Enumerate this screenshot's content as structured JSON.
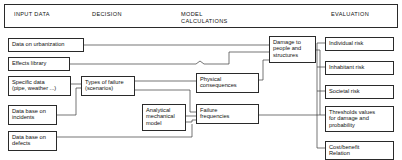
{
  "diagram": {
    "title_bar": {
      "columns": [
        {
          "id": "input-data",
          "label": "INPUT DATA"
        },
        {
          "id": "decision",
          "label": "DECISION"
        },
        {
          "id": "model-calculations",
          "label": "MODEL\nCALCULATIONS"
        },
        {
          "id": "evaluation",
          "label": "EVALUATION"
        }
      ]
    },
    "nodes": [
      {
        "id": "data-on-urbanization",
        "label": "Data on urbanization"
      },
      {
        "id": "effects-library",
        "label": "Effects library"
      },
      {
        "id": "specific-data",
        "label": "Specific data\n(pipe, weather ...)"
      },
      {
        "id": "data-base-on-incidents",
        "label": "Data base on\nincidents"
      },
      {
        "id": "data-base-on-defects",
        "label": "Data base on\ndefects"
      },
      {
        "id": "types-of-failure",
        "label": "Types of failure\n(scenarios)"
      },
      {
        "id": "analytical-mechanical-model",
        "label": "Analytical\nmechanical\nmodel"
      },
      {
        "id": "physical-consequences",
        "label": "Physical\nconsequences"
      },
      {
        "id": "failure-frequencies",
        "label": "Failure\nfrequencies"
      },
      {
        "id": "damage-to-people",
        "label": "Damage to\npeople and\nstructures"
      },
      {
        "id": "individual-risk",
        "label": "Individual risk"
      },
      {
        "id": "inhabitant-risk",
        "label": "Inhabitant risk"
      },
      {
        "id": "societal-risk",
        "label": "Societal risk"
      },
      {
        "id": "thresholds-values",
        "label": "Thresholds values\nfor damage and\nprobability"
      },
      {
        "id": "cost-benefit-relation",
        "label": "Cost/benefit\nRelation"
      }
    ],
    "colors": {
      "background": "#ffffff",
      "stroke": "#2a2a2a",
      "text": "#111111"
    }
  }
}
